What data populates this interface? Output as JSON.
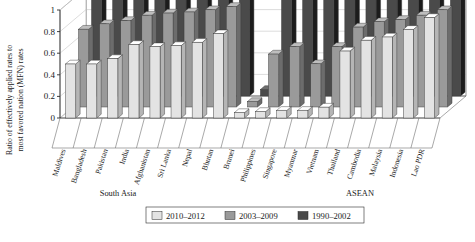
{
  "chart_data": {
    "type": "bar",
    "title": "",
    "subtitle": "",
    "xlabel": "",
    "ylabel": "Ratio of effectively applied rates to most favored nation (MFN) rates",
    "ylim": [
      0,
      1
    ],
    "yticks": [
      "0",
      "0.2",
      "0.4",
      "0.6",
      "0.8",
      "1"
    ],
    "ytick_values": [
      0,
      0.2,
      0.4,
      0.6,
      0.8,
      1
    ],
    "grid": true,
    "projection": "3d-grouped-bars",
    "legend_position": "bottom",
    "categories": [
      "Maldives",
      "Bangladesh",
      "Pakistan",
      "India",
      "Afghanistan",
      "Sri Lanka",
      "Nepal",
      "Bhutan",
      "Brunei",
      "Philippines",
      "Singapore",
      "Myanmar",
      "Vietnam",
      "Thailand",
      "Cambodia",
      "Malaysia",
      "Indonesia",
      "Lao PDR"
    ],
    "groups": [
      {
        "label": "South Asia",
        "categories": [
          "Maldives",
          "Bangladesh",
          "Pakistan",
          "India",
          "Afghanistan",
          "Sri Lanka",
          "Nepal",
          "Bhutan"
        ]
      },
      {
        "label": "ASEAN",
        "categories": [
          "Brunei",
          "Philippines",
          "Singapore",
          "Myanmar",
          "Vietnam",
          "Thailand",
          "Cambodia",
          "Malaysia",
          "Indonesia",
          "Lao PDR"
        ]
      }
    ],
    "series": [
      {
        "name": "2010–2012",
        "color": "#e3e3e3",
        "row": "front",
        "values": [
          0.5,
          0.5,
          0.55,
          0.68,
          0.66,
          0.67,
          0.7,
          0.78,
          0.05,
          0.06,
          0.07,
          0.07,
          0.1,
          0.62,
          0.72,
          0.75,
          0.82,
          0.93
        ]
      },
      {
        "name": "2003–2009",
        "color": "#9a9a9a",
        "row": "middle",
        "values": [
          0.72,
          0.77,
          0.8,
          0.85,
          0.87,
          0.88,
          0.9,
          0.93,
          0.05,
          0.49,
          0.56,
          0.4,
          0.56,
          0.74,
          0.79,
          0.81,
          0.85,
          0.9
        ]
      },
      {
        "name": "1990–2002",
        "color": "#4a4a4a",
        "row": "back",
        "values": [
          1.0,
          1.0,
          1.0,
          1.0,
          1.0,
          1.0,
          1.0,
          1.0,
          0.06,
          1.0,
          1.0,
          1.0,
          1.0,
          1.0,
          1.0,
          1.0,
          1.0,
          1.0
        ]
      }
    ]
  },
  "legend": {
    "items": [
      {
        "label": "2010–2012",
        "color": "#e3e3e3"
      },
      {
        "label": "2003–2009",
        "color": "#9a9a9a"
      },
      {
        "label": "1990–2002",
        "color": "#4a4a4a"
      }
    ]
  }
}
